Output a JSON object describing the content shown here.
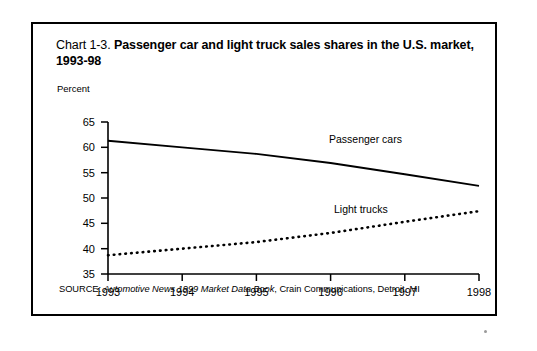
{
  "figure": {
    "title_number": "Chart 1-3.",
    "title_main": "Passenger car and light truck sales shares in the U.S. market, 1993-98",
    "source_prefix": "SOURCE:",
    "source_publication": "Automotive News 1999 Market Data Book",
    "source_rest": ", Crain Communications, Detroit, MI"
  },
  "chart_data": {
    "type": "line",
    "title": "Chart 1-3. Passenger car and light truck sales shares in the U.S. market, 1993-98",
    "xlabel": "",
    "ylabel": "Percent",
    "ylim": [
      35,
      65
    ],
    "xlim": [
      1993,
      1998
    ],
    "yticks": [
      35,
      40,
      45,
      50,
      55,
      60,
      65
    ],
    "xticks": [
      1993,
      1994,
      1995,
      1996,
      1997,
      1998
    ],
    "grid": false,
    "legend_position": "inline-annotation",
    "x": [
      1993,
      1994,
      1995,
      1996,
      1997,
      1998
    ],
    "series": [
      {
        "name": "Passenger cars",
        "style": "solid",
        "color": "#000000",
        "values": [
          61.3,
          60.0,
          58.7,
          56.9,
          54.7,
          52.4
        ]
      },
      {
        "name": "Light trucks",
        "style": "dotted",
        "color": "#000000",
        "values": [
          38.7,
          40.0,
          41.3,
          43.1,
          45.3,
          47.4
        ]
      }
    ],
    "annotations": [
      {
        "text": "Passenger cars",
        "x": 1996.0,
        "y": 60.2
      },
      {
        "text": "Light trucks",
        "x": 1996.15,
        "y": 46.3
      }
    ]
  },
  "axis": {
    "y_tick_labels": [
      "65",
      "60",
      "55",
      "50",
      "45",
      "40",
      "35"
    ],
    "x_tick_labels": [
      "1993",
      "1994",
      "1995",
      "1996",
      "1997",
      "1998"
    ],
    "unit_label": "Percent"
  }
}
